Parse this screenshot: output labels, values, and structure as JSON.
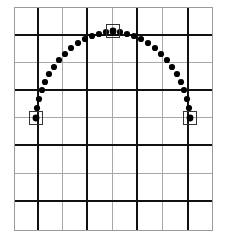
{
  "figure": {
    "width": 226,
    "height": 237,
    "background_color": "#ffffff"
  },
  "grid": {
    "outer_border_color": "#9a9a9a",
    "outer_border_width": 1,
    "major_line_color": "#111111",
    "major_line_width": 2.4,
    "minor_line_color": "#a8a8a8",
    "minor_line_width": 1.0,
    "x_min": 14,
    "x_max": 212,
    "y_min": 7,
    "y_max": 230,
    "vertical_lines": [
      {
        "x": 14,
        "type": "minor"
      },
      {
        "x": 38,
        "type": "major"
      },
      {
        "x": 62,
        "type": "minor"
      },
      {
        "x": 87,
        "type": "major"
      },
      {
        "x": 112,
        "type": "minor"
      },
      {
        "x": 137,
        "type": "major"
      },
      {
        "x": 162,
        "type": "minor"
      },
      {
        "x": 188,
        "type": "major"
      },
      {
        "x": 212,
        "type": "minor"
      }
    ],
    "horizontal_lines": [
      {
        "y": 7,
        "type": "minor"
      },
      {
        "y": 35,
        "type": "major"
      },
      {
        "y": 62,
        "type": "minor"
      },
      {
        "y": 90,
        "type": "major"
      },
      {
        "y": 117,
        "type": "minor"
      },
      {
        "y": 145,
        "type": "major"
      },
      {
        "y": 173,
        "type": "minor"
      },
      {
        "y": 201,
        "type": "major"
      },
      {
        "y": 230,
        "type": "minor"
      }
    ]
  },
  "chart_data": {
    "type": "scatter",
    "title": "Projectile trajectory",
    "xlabel": "",
    "ylabel": "",
    "grid": true,
    "legend_position": "none",
    "xlim": [
      14,
      212
    ],
    "ylim": [
      230,
      7
    ],
    "series": [
      {
        "name": "trajectory-dots",
        "marker": "circle",
        "color": "#000000",
        "radius": 3.1,
        "points": [
          [
            36,
            118
          ],
          [
            37,
            108
          ],
          [
            39,
            99
          ],
          [
            42,
            90
          ],
          [
            45,
            82
          ],
          [
            49,
            74
          ],
          [
            54,
            67
          ],
          [
            59,
            60
          ],
          [
            65,
            54
          ],
          [
            71,
            48
          ],
          [
            78,
            43
          ],
          [
            85,
            39
          ],
          [
            92,
            36
          ],
          [
            99,
            34
          ],
          [
            106,
            32
          ],
          [
            113,
            32
          ],
          [
            120,
            32
          ],
          [
            127,
            34
          ],
          [
            134,
            36
          ],
          [
            141,
            39
          ],
          [
            148,
            43
          ],
          [
            155,
            48
          ],
          [
            161,
            54
          ],
          [
            167,
            60
          ],
          [
            172,
            67
          ],
          [
            177,
            74
          ],
          [
            181,
            82
          ],
          [
            184,
            90
          ],
          [
            187,
            99
          ],
          [
            189,
            108
          ],
          [
            190,
            118
          ]
        ]
      }
    ],
    "annotations": [
      {
        "name": "launch-point-marker",
        "label": "launch point",
        "x": 36,
        "y": 118,
        "shape": "square",
        "size": 13,
        "edge_color": "#333333",
        "fill": "none",
        "dot_radius": 3.4
      },
      {
        "name": "apex-marker",
        "label": "apex",
        "x": 113,
        "y": 31,
        "shape": "square",
        "size": 13,
        "edge_color": "#333333",
        "fill": "none",
        "dot_radius": 3.4
      },
      {
        "name": "landing-point-marker",
        "label": "landing point",
        "x": 190,
        "y": 118,
        "shape": "square",
        "size": 13,
        "edge_color": "#333333",
        "fill": "none",
        "dot_radius": 3.4
      }
    ]
  }
}
